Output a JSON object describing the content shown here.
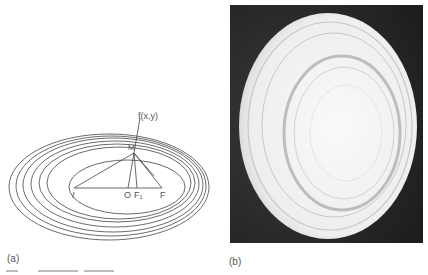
{
  "figure": {
    "panel_a": {
      "label": "(a)",
      "point_label": "f(x,y)",
      "point_m": "M",
      "axis_points": [
        "I",
        "O",
        "F₁",
        "F"
      ],
      "ellipse_count": 7,
      "line_color": "#555555"
    },
    "panel_b": {
      "label": "(b)",
      "description": "Photograph of a white elliptical dish with concentric raised rings on a dark background",
      "background_color": "#2a2a2a",
      "object_color": "#f2f2f2"
    },
    "caption": {
      "visible": "partially cut off, illegible"
    }
  }
}
